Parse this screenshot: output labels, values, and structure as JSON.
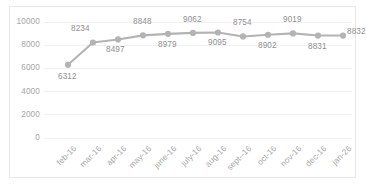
{
  "chart_data": {
    "type": "line",
    "title": "",
    "xlabel": "",
    "ylabel": "",
    "ylim": [
      0,
      10000
    ],
    "ytick_values": [
      10000,
      8000,
      6000,
      4000,
      2000,
      0
    ],
    "ytick_labels": [
      "10000",
      "8000",
      "6000",
      "4000",
      "2000",
      "0"
    ],
    "grid": true,
    "legend": "none",
    "categories": [
      "feb-16",
      "mar-16",
      "apr-16",
      "may-16",
      "june-16",
      "july-16",
      "aug-16",
      "sept--16",
      "oct-16",
      "nov-16",
      "dec-16",
      "jan-26"
    ],
    "values": [
      6312,
      8234,
      8497,
      8848,
      8979,
      9062,
      9095,
      8754,
      8902,
      9019,
      8831,
      8832
    ],
    "data_labels": [
      "6312",
      "8234",
      "8497",
      "8848",
      "8979",
      "9062",
      "9095",
      "8754",
      "8902",
      "9019",
      "8831",
      "8832"
    ],
    "series": [
      {
        "name": "series1",
        "values": [
          6312,
          8234,
          8497,
          8848,
          8979,
          9062,
          9095,
          8754,
          8902,
          9019,
          8831,
          8832
        ]
      }
    ]
  },
  "style": {
    "line_color": "#b3b3b3",
    "marker_color": "#b3b3b3",
    "grid_color": "#f1f1f1",
    "tick_text_color": "#a6a6a6",
    "data_label_color": "#8f8f8f",
    "frame_border_color": "#e8e8e8",
    "background": "#ffffff"
  },
  "ytick_positions": [
    22,
    45.2,
    68.4,
    91.6,
    114.8,
    138
  ],
  "xtick_positions": [
    68,
    93,
    118,
    143,
    168,
    193,
    218,
    243,
    268,
    293,
    318,
    343
  ],
  "label_offsets": [
    {
      "dx": -10,
      "dy": 12
    },
    {
      "dx": -22,
      "dy": -13
    },
    {
      "dx": -12,
      "dy": 11
    },
    {
      "dx": -10,
      "dy": -13
    },
    {
      "dx": -10,
      "dy": 11
    },
    {
      "dx": -10,
      "dy": -13
    },
    {
      "dx": -10,
      "dy": 11
    },
    {
      "dx": -10,
      "dy": -13
    },
    {
      "dx": -10,
      "dy": 11
    },
    {
      "dx": -10,
      "dy": -13
    },
    {
      "dx": -10,
      "dy": 11
    },
    {
      "dx": 4,
      "dy": -4
    }
  ]
}
